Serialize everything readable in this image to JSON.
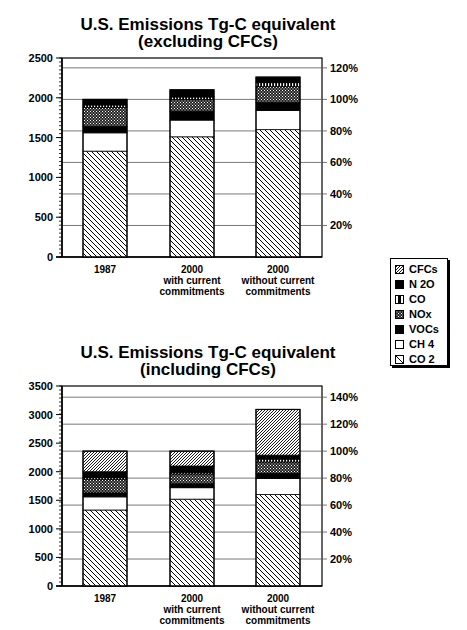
{
  "chart_data": [
    {
      "type": "bar",
      "stacked": true,
      "title": "U.S. Emissions Tg-C equivalent",
      "subtitle": "(excluding CFCs)",
      "categories": [
        "1987",
        "2000 with current commitments",
        "2000 without current commitments"
      ],
      "category_lines": [
        [
          "1987"
        ],
        [
          "2000",
          "with current",
          "commitments"
        ],
        [
          "2000",
          "without current",
          "commitments"
        ]
      ],
      "ylabel": "",
      "xlabel": "",
      "ylim": [
        0,
        2500
      ],
      "yticks": [
        0,
        500,
        1000,
        1500,
        2000,
        2500
      ],
      "y2ticks": [
        "20%",
        "40%",
        "60%",
        "80%",
        "100%",
        "120%"
      ],
      "y2_reference": "100% = 1987 total",
      "grid": true,
      "series": [
        {
          "name": "CO2",
          "values": [
            1330,
            1510,
            1600
          ]
        },
        {
          "name": "CH4",
          "values": [
            230,
            210,
            240
          ]
        },
        {
          "name": "VOCs",
          "values": [
            80,
            110,
            100
          ]
        },
        {
          "name": "NOx",
          "values": [
            240,
            150,
            200
          ]
        },
        {
          "name": "CO",
          "values": [
            30,
            30,
            50
          ]
        },
        {
          "name": "N2O",
          "values": [
            70,
            90,
            70
          ]
        }
      ],
      "totals": [
        1980,
        2100,
        2260
      ]
    },
    {
      "type": "bar",
      "stacked": true,
      "title": "U.S. Emissions Tg-C equivalent",
      "subtitle": "(including CFCs)",
      "categories": [
        "1987",
        "2000 with current commitments",
        "2000 without current commitments"
      ],
      "category_lines": [
        [
          "1987"
        ],
        [
          "2000",
          "with current",
          "commitments"
        ],
        [
          "2000",
          "without current",
          "commitments"
        ]
      ],
      "ylim": [
        0,
        3500
      ],
      "yticks": [
        0,
        500,
        1000,
        1500,
        2000,
        2500,
        3000,
        3500
      ],
      "y2ticks": [
        "20%",
        "40%",
        "60%",
        "80%",
        "100%",
        "120%",
        "140%"
      ],
      "grid": true,
      "series": [
        {
          "name": "CO2",
          "values": [
            1330,
            1520,
            1600
          ]
        },
        {
          "name": "CH4",
          "values": [
            230,
            200,
            280
          ]
        },
        {
          "name": "VOCs",
          "values": [
            70,
            70,
            90
          ]
        },
        {
          "name": "NOx",
          "values": [
            240,
            170,
            200
          ]
        },
        {
          "name": "CO",
          "values": [
            30,
            30,
            50
          ]
        },
        {
          "name": "N2O",
          "values": [
            100,
            110,
            70
          ]
        },
        {
          "name": "CFCs",
          "values": [
            360,
            260,
            800
          ]
        }
      ],
      "totals": [
        2360,
        2360,
        3090
      ]
    }
  ],
  "legend": {
    "items": [
      {
        "label": "CFCs",
        "pattern": "cfc"
      },
      {
        "label": "N 2O",
        "pattern": "black"
      },
      {
        "label": "CO",
        "pattern": "vstripe"
      },
      {
        "label": "NOx",
        "pattern": "dots"
      },
      {
        "label": "VOCs",
        "pattern": "black"
      },
      {
        "label": "CH 4",
        "pattern": "white"
      },
      {
        "label": "CO 2",
        "pattern": "hatch"
      }
    ]
  },
  "patterns": {
    "CO2": "hatch",
    "CH4": "white",
    "VOCs": "black",
    "NOx": "dots",
    "CO": "vstripe",
    "N2O": "black",
    "CFCs": "cfc"
  }
}
